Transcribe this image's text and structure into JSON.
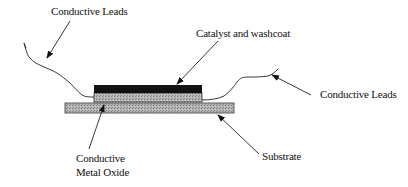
{
  "diagram": {
    "type": "schematic cross-section",
    "labels": {
      "leads_left": "Conductive Leads",
      "catalyst": "Catalyst and washcoat",
      "leads_right": "Conductive Leads",
      "substrate": "Substrate",
      "metal_oxide_line1": "Conductive",
      "metal_oxide_line2": "Metal Oxide"
    },
    "layers": [
      {
        "name": "Catalyst and washcoat",
        "fill": "#111111"
      },
      {
        "name": "Conductive Metal Oxide",
        "fill": "#a8a8a8"
      },
      {
        "name": "Substrate",
        "fill": "#a8a8a8"
      }
    ],
    "colors": {
      "line": "#222222",
      "catalyst": "#111111",
      "hatch_light": "#c4c4c4",
      "hatch_dark": "#8c8c8c"
    }
  }
}
